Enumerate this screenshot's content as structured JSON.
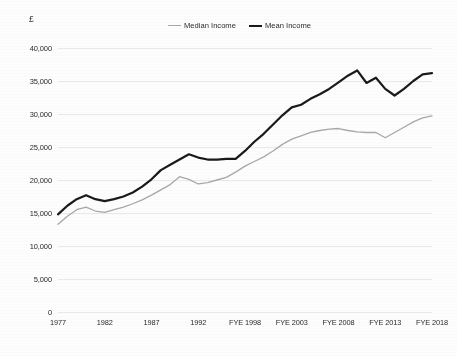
{
  "chart_data": {
    "type": "line",
    "title": "",
    "subtitle": "",
    "xlabel": "",
    "ylabel": "",
    "y_unit_label": "£",
    "ylim": [
      0,
      40000
    ],
    "y_ticks": [
      "0",
      "5,000",
      "10,000",
      "15,000",
      "20,000",
      "25,000",
      "30,000",
      "35,000",
      "40,000"
    ],
    "y_tick_values": [
      0,
      5000,
      10000,
      15000,
      20000,
      25000,
      30000,
      35000,
      40000
    ],
    "grid": "horizontal",
    "legend_position": "top-center",
    "x_tick_labels": [
      "1977",
      "1982",
      "1987",
      "1992",
      "FYE 1998",
      "FYE 2003",
      "FYE 2008",
      "FYE 2013",
      "FYE 2018"
    ],
    "x_tick_indices": [
      0,
      5,
      10,
      15,
      20,
      25,
      30,
      35,
      40
    ],
    "x": [
      "1977",
      "1978",
      "1979",
      "1980",
      "1981",
      "1982",
      "1983",
      "1984",
      "1985",
      "1986",
      "1987",
      "1988",
      "1989",
      "1990",
      "1991",
      "1992",
      "1993",
      "1994",
      "1995",
      "1996",
      "FYE 1998",
      "FYE 1999",
      "FYE 2000",
      "FYE 2001",
      "FYE 2002",
      "FYE 2003",
      "FYE 2004",
      "FYE 2005",
      "FYE 2006",
      "FYE 2007",
      "FYE 2008",
      "FYE 2009",
      "FYE 2010",
      "FYE 2011",
      "FYE 2012",
      "FYE 2013",
      "FYE 2014",
      "FYE 2015",
      "FYE 2016",
      "FYE 2017",
      "FYE 2018"
    ],
    "series": [
      {
        "name": "Median Income",
        "color": "#a8a8a8",
        "line_width": 1.3,
        "values": [
          13300,
          14500,
          15500,
          15900,
          15300,
          15100,
          15500,
          15900,
          16400,
          17000,
          17700,
          18500,
          19300,
          20500,
          20100,
          19400,
          19600,
          20000,
          20400,
          21200,
          22100,
          22800,
          23500,
          24400,
          25400,
          26200,
          26700,
          27200,
          27500,
          27700,
          27800,
          27500,
          27300,
          27200,
          27200,
          26400,
          27200,
          28000,
          28800,
          29400,
          29700
        ]
      },
      {
        "name": "Mean Income",
        "color": "#1a1a1a",
        "line_width": 2.2,
        "values": [
          14800,
          16100,
          17100,
          17700,
          17100,
          16800,
          17100,
          17500,
          18100,
          19000,
          20100,
          21500,
          22300,
          23100,
          23900,
          23400,
          23100,
          23100,
          23200,
          23200,
          24400,
          25800,
          27000,
          28400,
          29800,
          31000,
          31400,
          32300,
          33000,
          33800,
          34800,
          35800,
          36600,
          34700,
          35500,
          33800,
          32800,
          33800,
          35000,
          36000,
          36200
        ]
      }
    ]
  }
}
